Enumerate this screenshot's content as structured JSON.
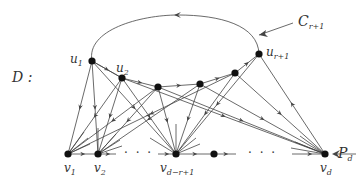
{
  "diagram": {
    "title_label": "D :",
    "cycle_label": {
      "main": "C",
      "sub": "r+1"
    },
    "path_label": {
      "main": "P",
      "sub": "d"
    },
    "colors": {
      "stroke": "#444444",
      "node": "#111111",
      "text": "#333333",
      "background": "#ffffff"
    },
    "upper_nodes": [
      {
        "id": "u1",
        "main": "u",
        "sub": "1",
        "x": 92,
        "y": 61
      },
      {
        "id": "u2",
        "main": "u",
        "sub": "2",
        "x": 122,
        "y": 78
      },
      {
        "id": "u3",
        "main": "",
        "sub": "",
        "x": 158,
        "y": 87
      },
      {
        "id": "u4",
        "main": "",
        "sub": "",
        "x": 200,
        "y": 84
      },
      {
        "id": "u5",
        "main": "",
        "sub": "",
        "x": 235,
        "y": 73
      },
      {
        "id": "ur1",
        "main": "u",
        "sub": "r+1",
        "x": 259,
        "y": 54
      }
    ],
    "lower_nodes": [
      {
        "id": "v1",
        "main": "v",
        "sub": "1",
        "x": 68,
        "y": 154
      },
      {
        "id": "v2",
        "main": "v",
        "sub": "2",
        "x": 98,
        "y": 154
      },
      {
        "id": "vdr1",
        "main": "v",
        "sub": "d−r+1",
        "x": 176,
        "y": 154
      },
      {
        "id": "vm",
        "main": "",
        "sub": "",
        "x": 214,
        "y": 154
      },
      {
        "id": "vd",
        "main": "v",
        "sub": "d",
        "x": 325,
        "y": 154
      }
    ],
    "ellipsis": "· · ·"
  }
}
